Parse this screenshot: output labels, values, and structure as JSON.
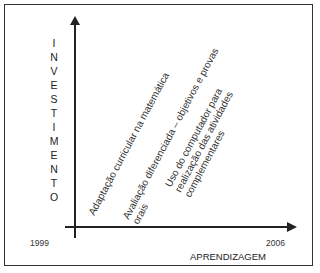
{
  "diagram": {
    "y_axis_label": [
      "I",
      "N",
      "V",
      "E",
      "S",
      "T",
      "I",
      "M",
      "E",
      "N",
      "T",
      "O"
    ],
    "x_axis_label": "APRENDIZAGEM",
    "x_start": "1999",
    "x_end": "2006",
    "items": [
      {
        "lines": [
          "Adaptação curricular na matemática"
        ]
      },
      {
        "lines": [
          "Avaliação diferenciada – objetivos e provas",
          "orais"
        ]
      },
      {
        "lines": [
          "Uso do computador para",
          "realização das atividades",
          "complementares"
        ]
      }
    ]
  }
}
